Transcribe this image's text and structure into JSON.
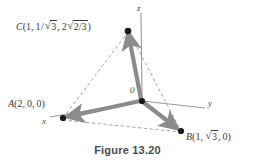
{
  "figure": {
    "caption": "Figure 13.20",
    "colors": {
      "vector_gray": "#8c8c8c",
      "axis_gray": "#9a9a9a",
      "dashed_gray": "#9a9a9a",
      "vertex_black": "#1a1a1a",
      "text_gray": "#3a3a3a",
      "background": "#ffffff"
    },
    "axes": [
      {
        "id": "x",
        "label": "x",
        "label_x": 42,
        "label_y": 121
      },
      {
        "id": "y",
        "label": "y",
        "label_x": 208,
        "label_y": 101
      },
      {
        "id": "z",
        "label": "z",
        "label_x": 137,
        "label_y": 4
      }
    ],
    "origin": {
      "label": "0",
      "label_x": 130,
      "label_y": 86,
      "x": 142,
      "y": 101
    },
    "points": [
      {
        "id": "A",
        "name": "A",
        "coords_text": "A(2,0,0)",
        "x": 63,
        "y": 118,
        "label_x": 8,
        "label_y": 99,
        "components": [
          "2",
          "0",
          "0"
        ]
      },
      {
        "id": "B",
        "name": "B",
        "coords_text": "B(1,√3,0)",
        "x": 181,
        "y": 131,
        "label_x": 186,
        "label_y": 130,
        "components": [
          "1",
          "√3",
          "0"
        ]
      },
      {
        "id": "C",
        "name": "C",
        "coords_text": "C(1,1/√3,2√(2/3))",
        "x": 128,
        "y": 31,
        "label_x": 16,
        "label_y": 20,
        "components": [
          "1",
          "1/√3",
          "2√(2/3)"
        ]
      }
    ],
    "vectors": [
      {
        "id": "OA",
        "from": "origin",
        "to": "A"
      },
      {
        "id": "OB",
        "from": "origin",
        "to": "B"
      },
      {
        "id": "OC",
        "from": "origin",
        "to": "C"
      }
    ],
    "dashed_edges": [
      {
        "id": "CA",
        "from": "C",
        "to": "A"
      },
      {
        "id": "AB",
        "from": "A",
        "to": "B"
      },
      {
        "id": "CB",
        "from": "C",
        "to": "B"
      }
    ]
  }
}
